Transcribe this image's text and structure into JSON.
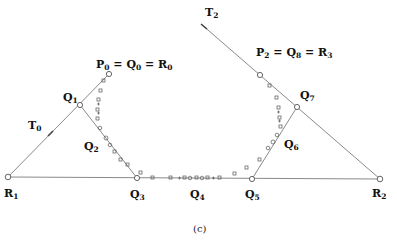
{
  "figure": {
    "caption": "(c)",
    "colors": {
      "line": "#8a8a8a",
      "marker": "#555555",
      "text": "#111111"
    },
    "points": {
      "R1": {
        "x": 8,
        "y": 177
      },
      "Q1": {
        "x": 80,
        "y": 105
      },
      "P0": {
        "x": 109,
        "y": 74
      },
      "Q2": {
        "x": 108,
        "y": 142
      },
      "Q3": {
        "x": 137,
        "y": 178
      },
      "Q4": {
        "x": 196,
        "y": 178
      },
      "Q5": {
        "x": 252,
        "y": 179
      },
      "Q6": {
        "x": 275,
        "y": 143
      },
      "Q7": {
        "x": 297,
        "y": 107
      },
      "P2": {
        "x": 260,
        "y": 75
      },
      "R2": {
        "x": 380,
        "y": 179
      },
      "T2start": {
        "x": 201,
        "y": 24
      }
    },
    "labels": {
      "P0": {
        "main": "P",
        "sub": "0",
        "eq1": "Q",
        "eq1sub": "0",
        "eq2": "R",
        "eq2sub": "0"
      },
      "P2": {
        "main": "P",
        "sub": "2",
        "eq1": "Q",
        "eq1sub": "8",
        "eq2": "R",
        "eq2sub": "3"
      },
      "Q1": {
        "main": "Q",
        "sub": "1"
      },
      "Q2": {
        "main": "Q",
        "sub": "2"
      },
      "Q3": {
        "main": "Q",
        "sub": "3"
      },
      "Q4": {
        "main": "Q",
        "sub": "4"
      },
      "Q5": {
        "main": "Q",
        "sub": "5"
      },
      "Q6": {
        "main": "Q",
        "sub": "6"
      },
      "Q7": {
        "main": "Q",
        "sub": "7"
      },
      "R1": {
        "main": "R",
        "sub": "1"
      },
      "R2": {
        "main": "R",
        "sub": "2"
      },
      "T0": {
        "main": "T",
        "sub": "0"
      },
      "T2": {
        "main": "T",
        "sub": "2"
      }
    }
  }
}
